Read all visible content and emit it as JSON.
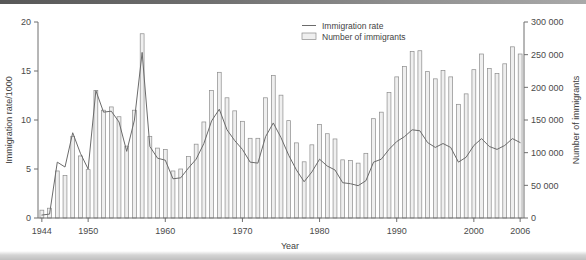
{
  "chart_data": {
    "type": "bar",
    "title": "",
    "xlabel": "Year",
    "ylabel": "Immigration rate/1000",
    "y2label": "Number of immigrants",
    "grid": false,
    "legend_position": "top-center-right",
    "ylim": [
      0,
      20
    ],
    "y2lim": [
      0,
      300000
    ],
    "xlim": [
      1944,
      2006
    ],
    "yticks": [
      0,
      5,
      10,
      15,
      20
    ],
    "y2ticks": [
      0,
      50000,
      100000,
      150000,
      200000,
      250000,
      300000
    ],
    "y2ticklabels": [
      "0",
      "50 000",
      "100 000",
      "150 000",
      "200 000",
      "250 000",
      "300 000"
    ],
    "xticks": [
      1944,
      1950,
      1960,
      1970,
      1980,
      1990,
      2000,
      2006
    ],
    "xticklabels": [
      "1944",
      "1950",
      "1960",
      "1970",
      "1980",
      "1990",
      "2000",
      "2006"
    ],
    "categories": [
      1944,
      1945,
      1946,
      1947,
      1948,
      1949,
      1950,
      1951,
      1952,
      1953,
      1954,
      1955,
      1956,
      1957,
      1958,
      1959,
      1960,
      1961,
      1962,
      1963,
      1964,
      1965,
      1966,
      1967,
      1968,
      1969,
      1970,
      1971,
      1972,
      1973,
      1974,
      1975,
      1976,
      1977,
      1978,
      1979,
      1980,
      1981,
      1982,
      1983,
      1984,
      1985,
      1986,
      1987,
      1988,
      1989,
      1990,
      1991,
      1992,
      1993,
      1994,
      1995,
      1996,
      1997,
      1998,
      1999,
      2000,
      2001,
      2002,
      2003,
      2004,
      2005,
      2006
    ],
    "series": [
      {
        "name": "Number of immigrants",
        "type": "bar",
        "axis": "right",
        "unit": "immigrants",
        "values": [
          12000,
          15000,
          72000,
          65000,
          125000,
          95000,
          74000,
          195000,
          165000,
          170000,
          155000,
          110000,
          165000,
          282000,
          125000,
          107000,
          105000,
          72000,
          75000,
          94000,
          113000,
          147000,
          195000,
          223000,
          184000,
          164000,
          148000,
          122000,
          122000,
          184000,
          218000,
          188000,
          149000,
          115000,
          86000,
          112000,
          143000,
          129000,
          121000,
          89000,
          88000,
          84000,
          99000,
          152000,
          162000,
          192000,
          216000,
          232000,
          255000,
          256000,
          224000,
          213000,
          226000,
          216000,
          174000,
          190000,
          227000,
          251000,
          229000,
          221000,
          236000,
          262000,
          251000
        ]
      },
      {
        "name": "Immigration rate",
        "type": "line",
        "axis": "left",
        "unit": "per 1000",
        "values": [
          0.3,
          0.4,
          5.7,
          5.2,
          8.7,
          6.6,
          5.0,
          13.0,
          10.8,
          10.9,
          9.8,
          6.8,
          10.0,
          16.9,
          7.3,
          6.1,
          5.9,
          4.0,
          4.1,
          5.1,
          6.0,
          7.6,
          9.9,
          11.1,
          9.0,
          7.9,
          7.0,
          5.7,
          5.6,
          8.3,
          9.7,
          8.2,
          6.4,
          4.9,
          3.7,
          4.7,
          6.0,
          5.3,
          4.9,
          3.6,
          3.5,
          3.3,
          3.8,
          5.7,
          6.0,
          7.0,
          7.8,
          8.3,
          9.0,
          8.9,
          7.7,
          7.2,
          7.6,
          7.2,
          5.7,
          6.2,
          7.4,
          8.1,
          7.3,
          7.0,
          7.4,
          8.1,
          7.7
        ]
      }
    ]
  },
  "legend": {
    "items": [
      {
        "label": "Immigration rate",
        "marker": "line"
      },
      {
        "label": "Number of immigrants",
        "marker": "bar-swatch"
      }
    ]
  },
  "axes": {
    "left_title": "Immigration rate/1000",
    "right_title": "Number of immigrants",
    "bottom_title": "Year"
  }
}
